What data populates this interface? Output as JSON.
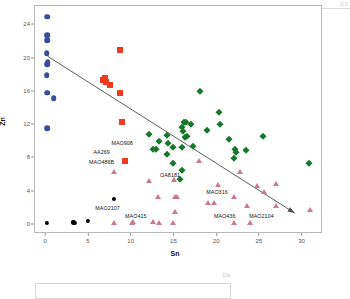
{
  "chart": {
    "type": "scatter",
    "title": "",
    "xlabel": "Sn",
    "ylabel": "Zn",
    "xlim": [
      -1.2,
      32.5
    ],
    "ylim": [
      -1.2,
      26.2
    ],
    "xticks": [
      0,
      5,
      10,
      15,
      20,
      25,
      30
    ],
    "yticks": [
      0,
      4,
      8,
      12,
      16,
      20,
      24
    ],
    "grid": false,
    "legend": "none",
    "colors": {
      "blue": "#3B4C9B",
      "red": "#EE3B1E",
      "green": "#17772B",
      "pink": "#C97A8E",
      "black": "#000000",
      "trend": "#4a4a4a",
      "axis": "#b9b9b9"
    },
    "series": [
      {
        "name": "blue-circles",
        "marker": "circle",
        "color": "#3B4C9B",
        "points": [
          [
            0.25,
            24.9
          ],
          [
            0.2,
            22.7
          ],
          [
            0.2,
            22.1
          ],
          [
            0.15,
            20.5
          ],
          [
            0.3,
            19.5
          ],
          [
            0.2,
            19.2
          ],
          [
            0.15,
            17.9
          ],
          [
            0.2,
            15.8
          ],
          [
            1.0,
            15.1
          ],
          [
            0.2,
            11.5
          ]
        ]
      },
      {
        "name": "red-squares",
        "marker": "square",
        "color": "#EE3B1E",
        "points": [
          [
            8.8,
            20.9
          ],
          [
            7.0,
            17.6
          ],
          [
            7.1,
            17.1
          ],
          [
            6.7,
            17.3
          ],
          [
            7.6,
            16.7
          ],
          [
            8.8,
            15.7
          ],
          [
            9.0,
            12.3
          ],
          [
            9.3,
            7.6
          ]
        ]
      },
      {
        "name": "green-diamonds",
        "marker": "diamond",
        "color": "#17772B",
        "points": [
          [
            18.1,
            16.0
          ],
          [
            20.3,
            13.5
          ],
          [
            16.2,
            12.3
          ],
          [
            17.0,
            12.0
          ],
          [
            20.5,
            12.0
          ],
          [
            18.9,
            11.3
          ],
          [
            16.0,
            11.6
          ],
          [
            16.1,
            11.2
          ],
          [
            12.1,
            10.8
          ],
          [
            14.2,
            10.7
          ],
          [
            16.3,
            10.4
          ],
          [
            16.6,
            10.6
          ],
          [
            13.3,
            10.0
          ],
          [
            14.4,
            9.7
          ],
          [
            21.5,
            10.2
          ],
          [
            12.6,
            9.0
          ],
          [
            13.0,
            9.0
          ],
          [
            15.0,
            9.2
          ],
          [
            16.0,
            9.3
          ],
          [
            17.3,
            9.4
          ],
          [
            14.2,
            8.4
          ],
          [
            22.2,
            9.0
          ],
          [
            22.3,
            8.6
          ],
          [
            23.5,
            8.9
          ],
          [
            25.5,
            10.6
          ],
          [
            15.0,
            7.3
          ],
          [
            16.0,
            6.5
          ],
          [
            22.1,
            7.9
          ],
          [
            15.8,
            5.4
          ],
          [
            30.9,
            7.3
          ],
          [
            16.5,
            12.3
          ]
        ]
      },
      {
        "name": "pink-triangles",
        "marker": "triangle",
        "color": "#C97A8E",
        "points": [
          [
            18.0,
            7.6
          ],
          [
            22.8,
            6.2
          ],
          [
            8.0,
            6.2
          ],
          [
            12.1,
            5.2
          ],
          [
            15.1,
            5.3
          ],
          [
            20.2,
            4.7
          ],
          [
            24.8,
            4.6
          ],
          [
            27.0,
            4.8
          ],
          [
            22.1,
            3.3
          ],
          [
            25.6,
            3.8
          ],
          [
            13.2,
            3.2
          ],
          [
            15.2,
            3.3
          ],
          [
            15.4,
            3.3
          ],
          [
            19.0,
            2.5
          ],
          [
            19.8,
            2.5
          ],
          [
            23.6,
            2.2
          ],
          [
            27.0,
            2.2
          ],
          [
            31.0,
            1.7
          ],
          [
            15.2,
            1.4
          ],
          [
            12.6,
            0.3
          ],
          [
            13.3,
            0.1
          ],
          [
            8.1,
            0.1
          ],
          [
            10.2,
            0.1
          ],
          [
            22.1,
            0.1
          ],
          [
            24.0,
            0.1
          ],
          [
            14.9,
            0.1
          ],
          [
            10.3,
            0.2
          ]
        ]
      },
      {
        "name": "black-circles",
        "marker": "circle",
        "color": "#000000",
        "points": [
          [
            0.2,
            0.1
          ],
          [
            3.3,
            0.2
          ],
          [
            3.5,
            0.1
          ],
          [
            5.0,
            0.4
          ],
          [
            8.0,
            3.0
          ]
        ]
      }
    ],
    "annotations": [
      {
        "text": "MAO908",
        "x": 9.0,
        "y": 9.7
      },
      {
        "text": "AA269",
        "x": 6.6,
        "y": 8.6
      },
      {
        "text": "MAO486B",
        "x": 6.6,
        "y": 7.4
      },
      {
        "text": "OA8181",
        "x": 14.6,
        "y": 5.9
      },
      {
        "text": "MAO2107",
        "x": 7.3,
        "y": 1.9
      },
      {
        "text": "MAO415",
        "x": 10.6,
        "y": 1.0
      },
      {
        "text": "MAO316",
        "x": 20.1,
        "y": 3.9
      },
      {
        "text": "MAO436",
        "x": 21.0,
        "y": 1.0
      },
      {
        "text": "MAO2104",
        "x": 25.3,
        "y": 1.0
      }
    ],
    "trendline": {
      "x1": 0.3,
      "y1": 20.1,
      "x2": 29.4,
      "y2": 1.1,
      "arrow": "end"
    }
  },
  "artifacts": {
    "top_right": "3/3",
    "bottom_right": "33a"
  }
}
